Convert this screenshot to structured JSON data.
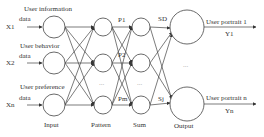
{
  "diagram": {
    "type": "neural-network",
    "layers": {
      "input": "Input",
      "pattern": "Pattern",
      "sum": "Sum",
      "output": "Output"
    },
    "inputs": [
      {
        "var": "X1",
        "label_line1": "User information",
        "label_line2": "data"
      },
      {
        "var": "X2",
        "label_line1": "User behavior",
        "label_line2": "data"
      },
      {
        "var": "Xn",
        "label_line1": "User preference",
        "label_line2": "data"
      }
    ],
    "pattern_labels": [
      "P1",
      "P2",
      "Pm"
    ],
    "sum_labels": [
      "SD",
      "Sj"
    ],
    "outputs": [
      {
        "label": "User portrait 1",
        "var": "Y1"
      },
      {
        "label": "User portrait n",
        "var": "Yn"
      }
    ],
    "ellipsis": "..."
  }
}
